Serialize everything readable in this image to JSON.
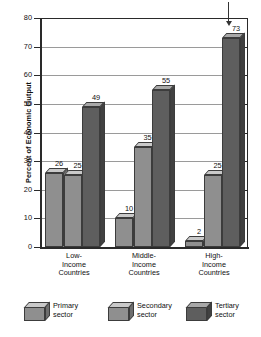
{
  "chart_data": {
    "type": "bar",
    "title": "",
    "xlabel": "",
    "ylabel": "Percent of Economic Output",
    "ylim": [
      0,
      80
    ],
    "ytick_labels": [
      "80",
      "70",
      "60",
      "50",
      "40",
      "30",
      "20",
      "10",
      "0"
    ],
    "ytick_values": [
      80,
      70,
      60,
      50,
      40,
      30,
      20,
      10,
      0
    ],
    "grid": true,
    "legend_position": "bottom",
    "categories": [
      "Low-\nIncome\nCountries",
      "Middle-\nIncome\nCountries",
      "High-\nIncome\nCountries"
    ],
    "category_lines": [
      [
        "Low-",
        "Income",
        "Countries"
      ],
      [
        "Middle-",
        "Income",
        "Countries"
      ],
      [
        "High-",
        "Income",
        "Countries"
      ]
    ],
    "series": [
      {
        "name": "Primary sector",
        "values": [
          26,
          10,
          2
        ],
        "color": "#8f8f8f"
      },
      {
        "name": "Secondary sector",
        "values": [
          25,
          35,
          25
        ],
        "color": "#8f8f8f"
      },
      {
        "name": "Tertiary sector",
        "values": [
          49,
          55,
          73
        ],
        "color": "#5e5e5e"
      }
    ],
    "annotation": {
      "type": "arrow",
      "target_value": 73,
      "target_series": "Tertiary sector",
      "target_category": "High-Income Countries"
    }
  },
  "legend": {
    "items": [
      {
        "line1": "Primary",
        "line2": "sector"
      },
      {
        "line1": "Secondary",
        "line2": "sector"
      },
      {
        "line1": "Tertiary",
        "line2": "sector"
      }
    ]
  },
  "colors": {
    "primary_fill": "#8f8f8f",
    "primary_top": "#c9c9c9",
    "primary_side": "#6e6e6e",
    "tertiary_fill": "#5e5e5e",
    "tertiary_top": "#a8a8a8",
    "tertiary_side": "#414141",
    "outline": "#3c3c3c",
    "grid": "#9a9a9a",
    "axis": "#2a2a2a",
    "background": "#ffffff"
  }
}
